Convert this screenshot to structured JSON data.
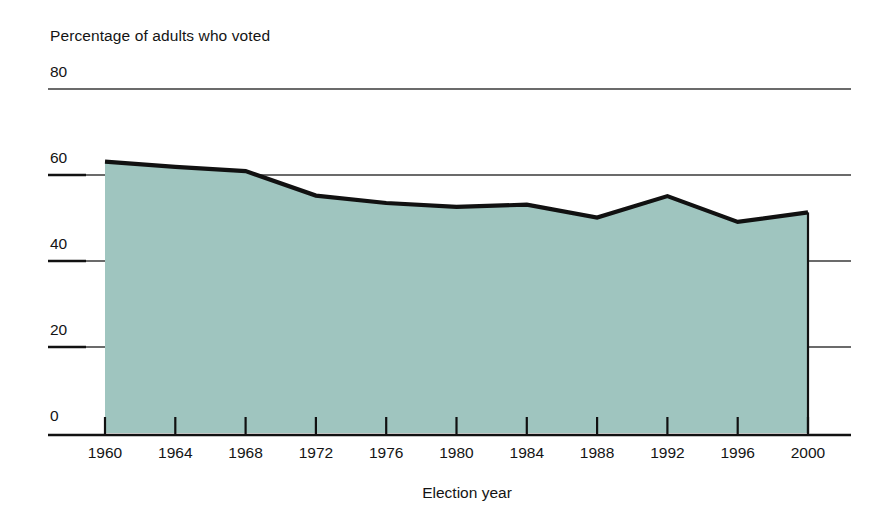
{
  "chart_data": {
    "type": "area",
    "title": "Percentage of adults who voted",
    "xlabel": "Election year",
    "ylabel": "",
    "categories": [
      "1960",
      "1964",
      "1968",
      "1972",
      "1976",
      "1980",
      "1984",
      "1988",
      "1992",
      "1996",
      "2000"
    ],
    "x": [
      1960,
      1964,
      1968,
      1972,
      1976,
      1980,
      1984,
      1988,
      1992,
      1996,
      2000
    ],
    "values": [
      63.1,
      61.9,
      60.9,
      55.2,
      53.5,
      52.6,
      53.1,
      50.1,
      55.1,
      49.1,
      51.3
    ],
    "series": [
      {
        "name": "Percentage of adults who voted",
        "values": [
          63.1,
          61.9,
          60.9,
          55.2,
          53.5,
          52.6,
          53.1,
          50.1,
          55.1,
          49.1,
          51.3
        ]
      }
    ],
    "ylim": [
      0,
      80
    ],
    "yticks": [
      0,
      20,
      40,
      60,
      80
    ],
    "ytick_labels": [
      "0",
      "20",
      "40",
      "60",
      "80"
    ],
    "xlim": [
      1960,
      2000
    ],
    "grid": true,
    "legend": "none",
    "area_fill_color": "#9fc5bf",
    "line_color": "#111111",
    "gridline_color": "#3a3a3a",
    "axis_color": "#111111"
  },
  "axis": {
    "y_labels": [
      "80",
      "60",
      "40",
      "20",
      "0"
    ],
    "x_labels": [
      "1960",
      "1964",
      "1968",
      "1972",
      "1976",
      "1980",
      "1984",
      "1988",
      "1992",
      "1996",
      "2000"
    ],
    "x_title": "Election year",
    "y_title": "Percentage of adults who voted"
  }
}
